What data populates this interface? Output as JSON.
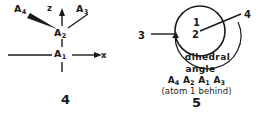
{
  "figure": {
    "stroke_color": "#1a1a1a",
    "background_color": "#ffffff"
  },
  "left_panel": {
    "number": "4",
    "atoms": [
      {
        "id": "a4",
        "label": "A",
        "subscript": "4",
        "bond_style": "bold-wedge"
      },
      {
        "id": "a3",
        "label": "A",
        "subscript": "3",
        "bond_style": "plain-line"
      },
      {
        "id": "a2",
        "label": "A",
        "subscript": "2",
        "bond_style": "center"
      },
      {
        "id": "a1",
        "label": "A",
        "subscript": "1",
        "bond_style": "origin"
      }
    ],
    "axes": [
      {
        "id": "z-axis",
        "label": "z",
        "direction": "up"
      },
      {
        "id": "x-axis",
        "label": "x",
        "direction": "right"
      }
    ]
  },
  "right_panel": {
    "number": "5",
    "newman": {
      "front_atom_label": "1",
      "back_atom_label": "2",
      "bond_labels": [
        {
          "id": "bond-3",
          "label": "3",
          "position": "left"
        },
        {
          "id": "bond-4",
          "label": "4",
          "position": "upper-right"
        }
      ]
    },
    "caption": {
      "line1": "dihedral",
      "line2": "angle",
      "formula_atoms": [
        {
          "label": "A",
          "subscript": "4"
        },
        {
          "label": "A",
          "subscript": "2"
        },
        {
          "label": "A",
          "subscript": "1"
        },
        {
          "label": "A",
          "subscript": "3"
        }
      ],
      "note": "(atom 1 behind)"
    }
  }
}
